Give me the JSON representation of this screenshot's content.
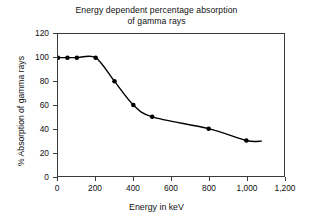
{
  "chart_data": {
    "type": "line",
    "title": "Energy dependent percentage absorption of gamma rays",
    "title_lines": [
      "Energy dependent percentage absorption",
      "of gamma rays"
    ],
    "xlabel": "Energy in keV",
    "ylabel": "% Absorption of gamma rays",
    "xlim": [
      0,
      1200
    ],
    "ylim": [
      0,
      120
    ],
    "xticks": [
      0,
      200,
      400,
      600,
      800,
      1000,
      1200
    ],
    "xtick_labels": [
      "0",
      "200",
      "400",
      "600",
      "800",
      "1,000",
      "1,200"
    ],
    "yticks": [
      0,
      20,
      40,
      60,
      80,
      100,
      120
    ],
    "ytick_labels": [
      "0",
      "20",
      "40",
      "60",
      "80",
      "100",
      "120"
    ],
    "grid": false,
    "legend": false,
    "series": [
      {
        "name": "Absorption of gamma rays",
        "marker": "filled-circle",
        "line_color": "#000000",
        "marker_color": "#000000",
        "x": [
          0,
          50,
          100,
          200,
          300,
          400,
          500,
          800,
          1000
        ],
        "values": [
          100,
          100,
          100,
          100,
          80,
          60,
          50,
          40,
          30
        ],
        "points": [
          {
            "x": 0,
            "y": 100
          },
          {
            "x": 50,
            "y": 100
          },
          {
            "x": 100,
            "y": 100
          },
          {
            "x": 200,
            "y": 100
          },
          {
            "x": 300,
            "y": 80
          },
          {
            "x": 400,
            "y": 60
          },
          {
            "x": 500,
            "y": 50
          },
          {
            "x": 800,
            "y": 40
          },
          {
            "x": 1000,
            "y": 30
          }
        ],
        "curve_tail_x": 1080,
        "curve_tail_y": 29.5
      }
    ]
  }
}
